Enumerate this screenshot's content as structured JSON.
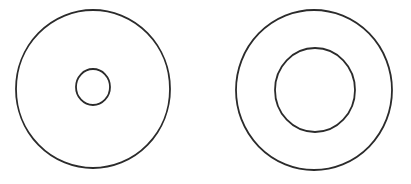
{
  "canvas": {
    "width": 411,
    "height": 184,
    "background": "#ffffff"
  },
  "stroke": {
    "color": "#2b2b2b",
    "width": 1.8,
    "fill": "none"
  },
  "figures": [
    {
      "label": "left-circle-with-small-center-circle",
      "outer": {
        "cx": 93,
        "cy": 89,
        "rx": 77,
        "ry": 79
      },
      "inner": {
        "cx": 93,
        "cy": 87,
        "rx": 17,
        "ry": 18
      }
    },
    {
      "label": "right-circle-with-medium-center-circle",
      "outer": {
        "cx": 314,
        "cy": 90,
        "rx": 78,
        "ry": 80
      },
      "inner": {
        "cx": 315,
        "cy": 90,
        "rx": 40,
        "ry": 42
      }
    }
  ]
}
